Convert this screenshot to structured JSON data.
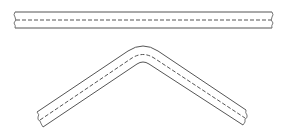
{
  "figure": {
    "colors": {
      "line": "#555555",
      "background": "#ffffff"
    },
    "parts": [
      {
        "name": "straight-strip",
        "label": ""
      },
      {
        "name": "bent-strip",
        "label": ""
      }
    ]
  }
}
